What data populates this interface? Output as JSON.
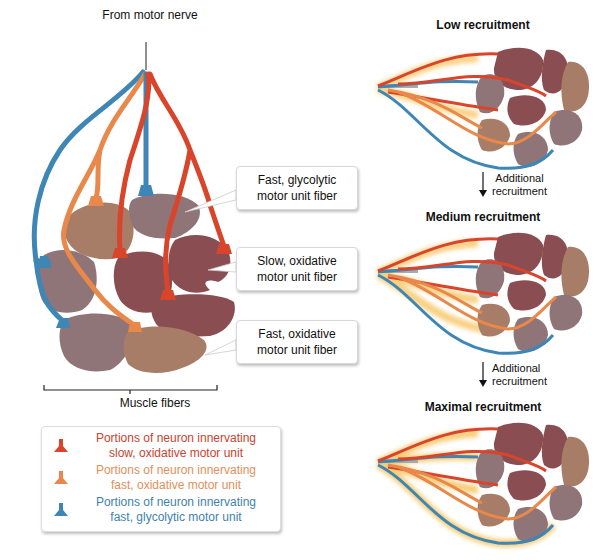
{
  "main_diagram": {
    "nerve_label": "From motor nerve",
    "callouts": [
      {
        "line1": "Fast, glycolytic",
        "line2": "motor unit fiber"
      },
      {
        "line1": "Slow, oxidative",
        "line2": "motor unit fiber"
      },
      {
        "line1": "Fast, oxidative",
        "line2": "motor unit fiber"
      }
    ],
    "bracket_label": "Muscle fibers"
  },
  "legend": {
    "items": [
      {
        "icon": "neuron-terminal-icon",
        "color": "#d9452b",
        "line1": "Portions of neuron innervating",
        "line2": "slow, oxidative motor unit"
      },
      {
        "icon": "neuron-terminal-icon",
        "color": "#e8884a",
        "line1": "Portions of neuron innervating",
        "line2": "fast, oxidative motor unit"
      },
      {
        "icon": "neuron-terminal-icon",
        "color": "#3d86b5",
        "line1": "Portions of neuron innervating",
        "line2": "fast, glycolytic motor unit"
      }
    ]
  },
  "stages": [
    {
      "title": "Low recruitment"
    },
    {
      "title": "Medium recruitment"
    },
    {
      "title": "Maximal recruitment"
    }
  ],
  "transitions": [
    {
      "line1": "Additional",
      "line2": "recruitment"
    },
    {
      "line1": "Additional",
      "line2": "recruitment"
    }
  ],
  "colors": {
    "slow_oxidative_nerve": "#d9452b",
    "fast_oxidative_nerve": "#e8884a",
    "fast_glycolytic_nerve": "#3d86b5",
    "slow_oxidative_fiber": "#8a4e52",
    "fast_oxidative_fiber": "#a87d68",
    "fast_glycolytic_fiber": "#8f7478",
    "glow": "#f7c86a"
  }
}
